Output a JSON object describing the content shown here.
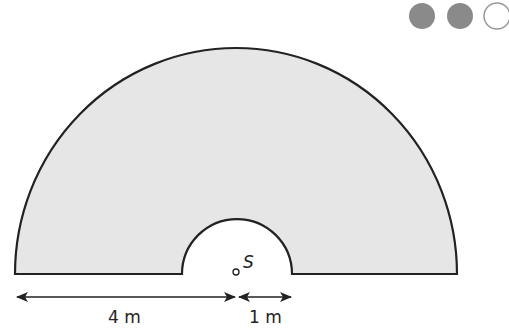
{
  "difficulty": {
    "filled": 2,
    "total": 3,
    "fill_color": "#8a8a8a"
  },
  "diagram": {
    "shape": "semicircular annulus (half ring)",
    "fill_color": "#e6e6e6",
    "outline_color": "#222222",
    "point_label": "S",
    "outer_width_label": "4 m",
    "inner_radius_label": "1 m"
  }
}
